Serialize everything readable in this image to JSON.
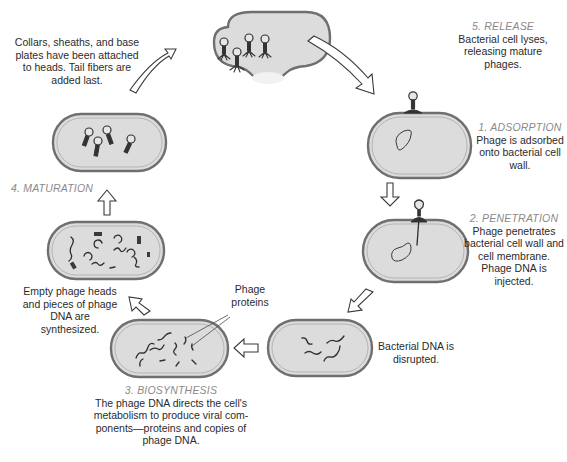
{
  "diagram": {
    "type": "lytic-cycle",
    "colors": {
      "cell_fill": "#dcdcdc",
      "cell_wall": "#6f6f6f",
      "step_title": "#8a8a8a",
      "body_text": "#2b2b2b",
      "arrow_outline": "#3a3a3a"
    },
    "steps": [
      {
        "id": "adsorption",
        "title": "1. ADSORPTION",
        "text": "Phage is adsorbed onto bacterial cell wall."
      },
      {
        "id": "penetration",
        "title": "2. PENETRATION",
        "text": "Phage penetrates bacterial cell wall and cell membrane.  Phage DNA is injected."
      },
      {
        "id": "dna-disrupted",
        "title": "",
        "text": "Bacterial DNA is disrupted."
      },
      {
        "id": "biosynthesis",
        "title": "3. BIOSYNTHESIS",
        "text": "The phage DNA directs the cell's metabolism to produce viral com-ponents—proteins and copies of phage DNA."
      },
      {
        "id": "synthesized-parts",
        "title": "",
        "text": "Empty phage heads and pieces of phage DNA are synthesized."
      },
      {
        "id": "maturation",
        "title": "4. MATURATION",
        "text": ""
      },
      {
        "id": "assembly",
        "title": "",
        "text": "Collars, sheaths, and base plates have been attached to heads.  Tail fibers are added last."
      },
      {
        "id": "release",
        "title": "5. RELEASE",
        "text": "Bacterial cell lyses, releasing mature phages."
      }
    ],
    "callouts": {
      "phage_proteins": "Phage proteins"
    }
  }
}
